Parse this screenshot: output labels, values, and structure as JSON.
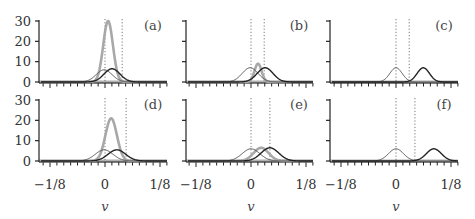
{
  "chart_data": [
    {
      "type": "line",
      "panel": "(a)",
      "xlabel": "",
      "xlim": [
        -0.15,
        0.15
      ],
      "ylim": [
        0,
        30
      ],
      "yticks": [
        "0",
        "10",
        "20",
        "30"
      ],
      "xticks": [],
      "dotted_lines_v": [
        0.0,
        0.039
      ],
      "series": [
        {
          "name": "gray (thick)",
          "color": "#a8a8a8",
          "peak_v": 0.007,
          "peak_height": 30,
          "width": 0.011
        },
        {
          "name": "thin",
          "color": "#555555",
          "peak_v": -0.002,
          "peak_height": 6,
          "width": 0.018
        },
        {
          "name": "black",
          "color": "#222222",
          "peak_v": 0.016,
          "peak_height": 6.5,
          "width": 0.018
        }
      ]
    },
    {
      "type": "line",
      "panel": "(b)",
      "xlabel": "",
      "xlim": [
        -0.15,
        0.15
      ],
      "ylim": [
        0,
        30
      ],
      "yticks": [],
      "xticks": [],
      "dotted_lines_v": [
        0.0,
        0.03
      ],
      "series": [
        {
          "name": "gray (thick)",
          "color": "#a8a8a8",
          "peak_v": 0.016,
          "peak_height": 9,
          "width": 0.008
        },
        {
          "name": "thin",
          "color": "#555555",
          "peak_v": -0.002,
          "peak_height": 7,
          "width": 0.018
        },
        {
          "name": "black",
          "color": "#222222",
          "peak_v": 0.032,
          "peak_height": 7,
          "width": 0.018
        }
      ]
    },
    {
      "type": "line",
      "panel": "(c)",
      "xlabel": "",
      "xlim": [
        -0.15,
        0.15
      ],
      "ylim": [
        0,
        30
      ],
      "yticks": [],
      "xticks": [],
      "dotted_lines_v": [
        0.0,
        0.03
      ],
      "series": [
        {
          "name": "thin",
          "color": "#555555",
          "peak_v": 0.0,
          "peak_height": 7,
          "width": 0.014
        },
        {
          "name": "black",
          "color": "#222222",
          "peak_v": 0.062,
          "peak_height": 7,
          "width": 0.014
        }
      ]
    },
    {
      "type": "line",
      "panel": "(d)",
      "xlabel": "v",
      "xlim": [
        -0.15,
        0.15
      ],
      "ylim": [
        0,
        30
      ],
      "yticks": [
        "0",
        "10",
        "20",
        "30"
      ],
      "xticks": [
        "−1/8",
        "0",
        "1/8"
      ],
      "dotted_lines_v": [
        0.0,
        0.048
      ],
      "series": [
        {
          "name": "gray (thick)",
          "color": "#a8a8a8",
          "peak_v": 0.014,
          "peak_height": 21,
          "width": 0.013
        },
        {
          "name": "thin",
          "color": "#555555",
          "peak_v": -0.002,
          "peak_height": 5.5,
          "width": 0.02
        },
        {
          "name": "black",
          "color": "#222222",
          "peak_v": 0.027,
          "peak_height": 5.5,
          "width": 0.02
        }
      ]
    },
    {
      "type": "line",
      "panel": "(e)",
      "xlabel": "v",
      "xlim": [
        -0.15,
        0.15
      ],
      "ylim": [
        0,
        30
      ],
      "yticks": [],
      "xticks": [
        "−1/8",
        "0",
        "1/8"
      ],
      "dotted_lines_v": [
        0.0,
        0.043
      ],
      "series": [
        {
          "name": "gray (thick)",
          "color": "#a8a8a8",
          "peak_v": 0.023,
          "peak_height": 6.5,
          "width": 0.017
        },
        {
          "name": "thin",
          "color": "#555555",
          "peak_v": 0.0,
          "peak_height": 6,
          "width": 0.02
        },
        {
          "name": "black",
          "color": "#222222",
          "peak_v": 0.043,
          "peak_height": 6.5,
          "width": 0.02
        }
      ]
    },
    {
      "type": "line",
      "panel": "(f)",
      "xlabel": "v",
      "xlim": [
        -0.15,
        0.15
      ],
      "ylim": [
        0,
        30
      ],
      "yticks": [],
      "xticks": [
        "−1/8",
        "0",
        "1/8"
      ],
      "dotted_lines_v": [
        0.0,
        0.043
      ],
      "series": [
        {
          "name": "thin",
          "color": "#555555",
          "peak_v": 0.0,
          "peak_height": 6,
          "width": 0.017
        },
        {
          "name": "black",
          "color": "#222222",
          "peak_v": 0.086,
          "peak_height": 6,
          "width": 0.017
        }
      ]
    }
  ],
  "layout": {
    "columns": [
      {
        "axis_x": 39,
        "zero_x": 105,
        "right_x": 167
      },
      {
        "axis_x": 186,
        "zero_x": 251,
        "right_x": 313
      },
      {
        "axis_x": 330,
        "zero_x": 396,
        "right_x": 458
      }
    ],
    "rows": [
      {
        "y0": 82,
        "y30": 21
      },
      {
        "y0": 161,
        "y30": 100
      }
    ],
    "px_per_unit_v": 440,
    "grid": false,
    "legend": "none"
  },
  "labels": {
    "panels": [
      "(a)",
      "(b)",
      "(c)",
      "(d)",
      "(e)",
      "(f)"
    ],
    "xlabel": "v",
    "xtick_labels": [
      "−1/8",
      "0",
      "1/8"
    ],
    "ytick_labels": [
      "0",
      "10",
      "20",
      "30"
    ]
  }
}
